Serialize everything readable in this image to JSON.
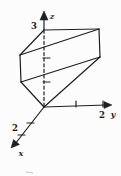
{
  "page": {
    "background": "#fcfcfc",
    "ink": "#1f1f1f",
    "artifact_color": "#c9c9c9"
  },
  "figure": {
    "kind": "hand-drawn 3d coordinate sketch of a solid",
    "axis_labels": {
      "x": "x",
      "y": "y",
      "z": "z"
    },
    "visible_numbers": {
      "z_axis": "3",
      "y_axis": "2",
      "x_axis": "2"
    },
    "lines": [
      {
        "name": "solid-top-edge-ab",
        "x1": 44,
        "y1": 30,
        "x2": 99,
        "y2": 29
      },
      {
        "name": "solid-top-edge-ac",
        "x1": 44,
        "y1": 30,
        "x2": 20,
        "y2": 55
      },
      {
        "name": "solid-top-diagonal-cb",
        "x1": 20,
        "y1": 55,
        "x2": 99,
        "y2": 29
      },
      {
        "name": "solid-left-edge-ce",
        "x1": 20,
        "y1": 55,
        "x2": 21,
        "y2": 82
      },
      {
        "name": "solid-mid-diagonal-ed",
        "x1": 21,
        "y1": 82,
        "x2": 100,
        "y2": 57
      },
      {
        "name": "solid-right-edge-bd",
        "x1": 99,
        "y1": 29,
        "x2": 100,
        "y2": 57
      },
      {
        "name": "solid-lower-edge-eo",
        "x1": 21,
        "y1": 82,
        "x2": 44,
        "y2": 107
      },
      {
        "name": "solid-lower-edge-do",
        "x1": 100,
        "y1": 57,
        "x2": 44,
        "y2": 107
      },
      {
        "name": "z-axis-line",
        "x1": 44,
        "y1": 30,
        "x2": 44,
        "y2": 19
      },
      {
        "name": "z-axis-hidden-dashed",
        "x1": 44,
        "y1": 106,
        "x2": 44,
        "y2": 31,
        "dash": "3,2.6"
      },
      {
        "name": "y-axis-line",
        "x1": 44,
        "y1": 107,
        "x2": 106,
        "y2": 105
      },
      {
        "name": "x-axis-line",
        "x1": 44,
        "y1": 107,
        "x2": 15,
        "y2": 144
      },
      {
        "name": "z-axis-tick-1",
        "x1": 43,
        "y1": 82,
        "x2": 50,
        "y2": 82
      },
      {
        "name": "z-axis-tick-2",
        "x1": 43,
        "y1": 58,
        "x2": 50,
        "y2": 58
      },
      {
        "name": "y-axis-tick-1",
        "x1": 76,
        "y1": 101,
        "x2": 76,
        "y2": 107
      },
      {
        "name": "y-axis-tick-2",
        "x1": 103,
        "y1": 101,
        "x2": 103,
        "y2": 107
      },
      {
        "name": "x-axis-tick-1",
        "x1": 27,
        "y1": 123,
        "x2": 34,
        "y2": 123
      },
      {
        "name": "x-axis-tick-2",
        "x1": 18,
        "y1": 135,
        "x2": 25,
        "y2": 135
      },
      {
        "name": "scan-artifact-dash",
        "x1": 26,
        "y1": 172,
        "x2": 33,
        "y2": 173,
        "color": "#c9c9c9",
        "width": 1
      }
    ],
    "arrowheads": [
      {
        "name": "z-axis-arrowhead",
        "points": "44,11 40,20 48,20"
      },
      {
        "name": "y-axis-arrowhead",
        "points": "112,105 104,101.5 104,108.5"
      },
      {
        "name": "x-axis-arrowhead",
        "points": "11,148 13.5,139.5 19.5,144.5"
      }
    ],
    "labels": [
      {
        "name": "z-axis-label",
        "text": "z",
        "x": 52,
        "y": 19,
        "size": 8,
        "italic": true,
        "anchor": "middle"
      },
      {
        "name": "z-axis-number-3",
        "text": "3",
        "x": 37,
        "y": 29,
        "size": 8.5,
        "italic": false,
        "anchor": "end"
      },
      {
        "name": "y-axis-number-2",
        "text": "2",
        "x": 102,
        "y": 118,
        "size": 8.5,
        "italic": false,
        "anchor": "middle"
      },
      {
        "name": "y-axis-label",
        "text": "y",
        "x": 113,
        "y": 117,
        "size": 8,
        "italic": true,
        "anchor": "middle"
      },
      {
        "name": "x-axis-number-2",
        "text": "2",
        "x": 15,
        "y": 131,
        "size": 8.5,
        "italic": false,
        "anchor": "middle"
      },
      {
        "name": "x-axis-label",
        "text": "x",
        "x": 21,
        "y": 156,
        "size": 8,
        "italic": true,
        "anchor": "middle"
      }
    ]
  }
}
